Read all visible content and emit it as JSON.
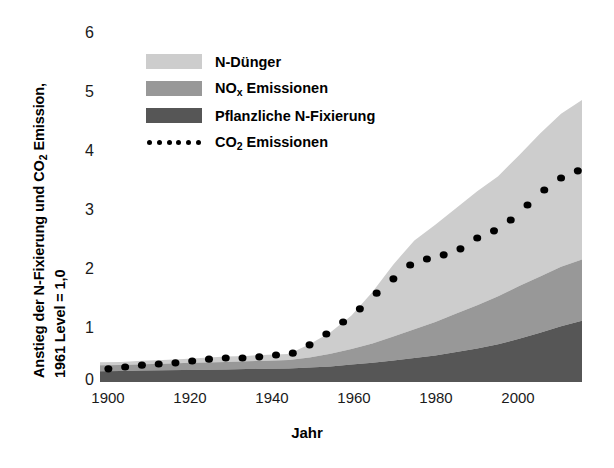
{
  "chart_data": {
    "type": "area",
    "title": "",
    "xlabel": "Jahr",
    "ylabel_line1": "Anstieg der N-Fixierung und CO",
    "ylabel_line1_sub": "2",
    "ylabel_line1_tail": " Emission,",
    "ylabel_line2": "1961 Level = 1,0",
    "xlim": [
      1900,
      2015
    ],
    "ylim": [
      0,
      6
    ],
    "xticks": [
      1900,
      1920,
      1940,
      1960,
      1980,
      2000
    ],
    "yticks": [
      0,
      1,
      2,
      3,
      4,
      5,
      6
    ],
    "grid": false,
    "legend_position": "upper-left-inside",
    "stacked": true,
    "colors": {
      "n_duenger": "#cdcdcd",
      "nox_emissionen": "#989898",
      "pflanzliche_n_fixierung": "#565656",
      "co2_emissionen": "#000000",
      "axis": "#000000",
      "text": "#000000"
    },
    "legend": [
      {
        "label": "N-Dünger",
        "type": "area",
        "color": "#cdcdcd"
      },
      {
        "label": "NO",
        "label_sub": "x",
        "label_tail": " Emissionen",
        "type": "area",
        "color": "#989898"
      },
      {
        "label": "Pflanzliche N-Fixierung",
        "type": "area",
        "color": "#565656"
      },
      {
        "label": "CO",
        "label_sub": "2",
        "label_tail": " Emissionen",
        "type": "dotted-line",
        "color": "#000000"
      }
    ],
    "x": [
      1900,
      1905,
      1910,
      1915,
      1920,
      1925,
      1930,
      1935,
      1940,
      1945,
      1950,
      1955,
      1960,
      1965,
      1970,
      1975,
      1980,
      1985,
      1990,
      1995,
      2000,
      2005,
      2010,
      2015
    ],
    "series": [
      {
        "name": "Pflanzliche N-Fixierung",
        "color": "#565656",
        "values": [
          0.18,
          0.185,
          0.19,
          0.195,
          0.2,
          0.205,
          0.21,
          0.215,
          0.22,
          0.225,
          0.24,
          0.26,
          0.29,
          0.32,
          0.36,
          0.4,
          0.44,
          0.5,
          0.56,
          0.63,
          0.72,
          0.82,
          0.93,
          1.02
        ]
      },
      {
        "name": "NOx Emissionen",
        "color": "#989898",
        "values": [
          0.1,
          0.1,
          0.105,
          0.11,
          0.115,
          0.12,
          0.125,
          0.13,
          0.135,
          0.14,
          0.17,
          0.21,
          0.26,
          0.32,
          0.4,
          0.48,
          0.56,
          0.64,
          0.72,
          0.8,
          0.88,
          0.94,
          0.99,
          1.02
        ]
      },
      {
        "name": "N-Dünger",
        "color": "#cdcdcd",
        "values": [
          0.05,
          0.05,
          0.06,
          0.06,
          0.07,
          0.08,
          0.09,
          0.09,
          0.1,
          0.1,
          0.22,
          0.36,
          0.56,
          0.86,
          1.2,
          1.48,
          1.62,
          1.76,
          1.9,
          2.0,
          2.18,
          2.38,
          2.55,
          2.66
        ]
      }
    ],
    "stack_totals": [
      0.33,
      0.335,
      0.355,
      0.365,
      0.385,
      0.405,
      0.425,
      0.435,
      0.455,
      0.465,
      0.63,
      0.83,
      1.11,
      1.5,
      1.96,
      2.36,
      2.62,
      2.9,
      3.18,
      3.43,
      3.78,
      4.14,
      4.47,
      4.7
    ],
    "co2_line": {
      "name": "CO2 Emissionen",
      "color": "#000000",
      "style": "dotted",
      "x": [
        1902,
        1906,
        1910,
        1914,
        1918,
        1922,
        1926,
        1930,
        1934,
        1938,
        1942,
        1946,
        1950,
        1954,
        1958,
        1962,
        1966,
        1970,
        1974,
        1978,
        1982,
        1986,
        1990,
        1994,
        1998,
        2002,
        2006,
        2010,
        2014
      ],
      "values": [
        0.22,
        0.25,
        0.28,
        0.3,
        0.32,
        0.35,
        0.38,
        0.4,
        0.4,
        0.42,
        0.45,
        0.48,
        0.62,
        0.8,
        1.0,
        1.22,
        1.48,
        1.72,
        1.95,
        2.05,
        2.12,
        2.22,
        2.4,
        2.52,
        2.7,
        2.95,
        3.2,
        3.4,
        3.52
      ]
    }
  }
}
